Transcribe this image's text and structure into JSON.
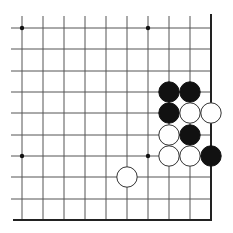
{
  "diagram": {
    "type": "go-board-fragment",
    "corner": "bottom-right",
    "columns": 10,
    "rows": 10,
    "grid_x": [
      22,
      43,
      64,
      85,
      106,
      127,
      148,
      169,
      190,
      211
    ],
    "grid_y": [
      28,
      49,
      71,
      92,
      113,
      135,
      156,
      177,
      199,
      220
    ],
    "line_color": "#555555",
    "edge_color": "#222222",
    "star_points": [
      {
        "col": 0,
        "row": 0
      },
      {
        "col": 6,
        "row": 0
      },
      {
        "col": 0,
        "row": 6
      },
      {
        "col": 6,
        "row": 6
      }
    ],
    "stones": [
      {
        "color": "black",
        "col": 7,
        "row": 3
      },
      {
        "color": "black",
        "col": 8,
        "row": 3
      },
      {
        "color": "black",
        "col": 7,
        "row": 4
      },
      {
        "color": "white",
        "col": 8,
        "row": 4
      },
      {
        "color": "white",
        "col": 9,
        "row": 4
      },
      {
        "color": "white",
        "col": 7,
        "row": 5
      },
      {
        "color": "black",
        "col": 8,
        "row": 5
      },
      {
        "color": "white",
        "col": 7,
        "row": 6
      },
      {
        "color": "white",
        "col": 8,
        "row": 6
      },
      {
        "color": "black",
        "col": 9,
        "row": 6
      },
      {
        "color": "white",
        "col": 5,
        "row": 7
      }
    ]
  }
}
